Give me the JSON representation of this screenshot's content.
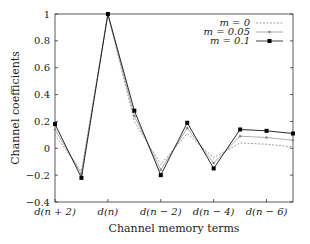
{
  "chart_data": {
    "type": "line",
    "title": "",
    "xlabel": "Channel memory terms",
    "ylabel": "Channel coefficients",
    "ylim": [
      -0.4,
      1
    ],
    "yticks": [
      -0.4,
      -0.2,
      0,
      0.2,
      0.4,
      0.6,
      0.8,
      1
    ],
    "ytick_labels": [
      "−0.4",
      "−0.2",
      "0",
      "0.2",
      "0.4",
      "0.6",
      "0.8",
      "1"
    ],
    "x": [
      "d(n+2)",
      "d(n+1)",
      "d(n)",
      "d(n-1)",
      "d(n-2)",
      "d(n-3)",
      "d(n-4)",
      "d(n-5)",
      "d(n-6)",
      "d(n-7)"
    ],
    "xtick_labels": [
      "d(n + 2)",
      "d(n)",
      "d(n − 2)",
      "d(n − 4)",
      "d(n − 6)"
    ],
    "xtick_indices": [
      0,
      2,
      4,
      6,
      8
    ],
    "grid": false,
    "legend_position": "upper right",
    "series": [
      {
        "name": "m = 0",
        "style": "dotted",
        "marker": "none",
        "color": "#888888",
        "values": [
          0.1,
          -0.17,
          1.0,
          0.2,
          -0.12,
          0.11,
          -0.07,
          0.04,
          0.03,
          0.01
        ]
      },
      {
        "name": "m = 0.05",
        "style": "solid",
        "marker": "small-dot",
        "color": "#999999",
        "values": [
          0.14,
          -0.19,
          1.0,
          0.24,
          -0.16,
          0.15,
          -0.11,
          0.09,
          0.08,
          0.06
        ]
      },
      {
        "name": "m = 0.1",
        "style": "solid",
        "marker": "square",
        "color": "#111111",
        "values": [
          0.18,
          -0.22,
          1.0,
          0.28,
          -0.2,
          0.19,
          -0.15,
          0.14,
          0.13,
          0.11
        ]
      }
    ]
  }
}
